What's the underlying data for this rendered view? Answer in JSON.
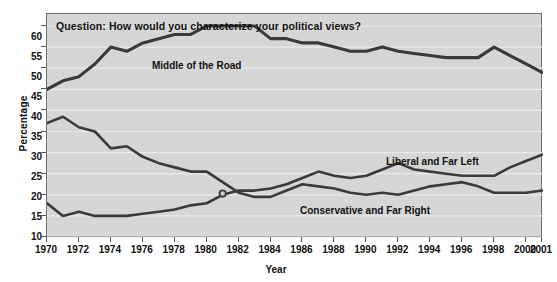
{
  "chart_data": {
    "type": "line",
    "title": "Question: How would you characterize your political views?",
    "xlabel": "Year",
    "ylabel": "Percentage",
    "ylim": [
      10,
      60
    ],
    "xlim": [
      1970,
      2001
    ],
    "ytick_step": 5,
    "xtick_step": 2,
    "grid": true,
    "legend_position": "inline-annotations",
    "plot_background": "#d6d6d6",
    "line_color": "#3a3a3a",
    "x": [
      1970,
      1971,
      1972,
      1973,
      1974,
      1975,
      1976,
      1977,
      1978,
      1979,
      1980,
      1981,
      1982,
      1983,
      1984,
      1985,
      1986,
      1987,
      1988,
      1989,
      1990,
      1991,
      1992,
      1993,
      1994,
      1995,
      1996,
      1997,
      1998,
      1999,
      2000,
      2001
    ],
    "xticks": [
      1970,
      1972,
      1974,
      1976,
      1978,
      1980,
      1982,
      1984,
      1986,
      1988,
      1990,
      1992,
      1994,
      1996,
      1998,
      2000,
      2001
    ],
    "yticks": [
      10,
      15,
      20,
      25,
      30,
      35,
      40,
      45,
      50,
      55,
      60
    ],
    "series": [
      {
        "name": "Middle of the Road",
        "values": [
          45,
          47,
          48,
          51,
          55,
          54,
          56,
          57,
          58,
          58,
          60,
          60,
          60,
          60,
          57,
          57,
          56,
          56,
          55,
          54,
          54,
          55,
          54,
          53.5,
          53,
          52.5,
          52.5,
          52.5,
          55,
          53,
          51,
          49
        ]
      },
      {
        "name": "Liberal and Far Left",
        "values": [
          37,
          38.5,
          36,
          35,
          31,
          31.5,
          29,
          27.5,
          26.5,
          25.5,
          25.5,
          23,
          20.5,
          19.5,
          19.5,
          21,
          22.5,
          22,
          21.5,
          20.5,
          20,
          20.5,
          20,
          21,
          22,
          22.5,
          23,
          22,
          20.5,
          20.5,
          20.5,
          21
        ]
      },
      {
        "name": "Conservative and Far Right",
        "values": [
          18,
          15,
          16,
          15,
          15,
          15,
          15.5,
          16,
          16.5,
          17.5,
          18,
          20,
          21,
          21,
          21.5,
          22.5,
          24,
          25.5,
          24.5,
          24,
          24.5,
          26,
          27.5,
          26,
          25.5,
          25,
          24.5,
          24.5,
          24.5,
          26.5,
          28,
          29.5
        ]
      }
    ],
    "marker_points": [
      {
        "x": 1981,
        "y": 20.3,
        "note": "crossover marker"
      }
    ]
  },
  "annotations": {
    "question": "Question: How would you characterize your political views?",
    "label_middle": "Middle of the Road",
    "label_liberal": "Liberal and Far Left",
    "label_conservative": "Conservative and Far Right"
  },
  "axes": {
    "y_title": "Percentage",
    "x_title": "Year",
    "y_labels": [
      "60",
      "55",
      "50",
      "45",
      "40",
      "35",
      "30",
      "25",
      "20",
      "15",
      "10"
    ],
    "x_labels": [
      "1970",
      "1972",
      "1974",
      "1976",
      "1978",
      "1980",
      "1982",
      "1984",
      "1986",
      "1988",
      "1990",
      "1992",
      "1994",
      "1996",
      "1998",
      "2000",
      "2001"
    ]
  }
}
